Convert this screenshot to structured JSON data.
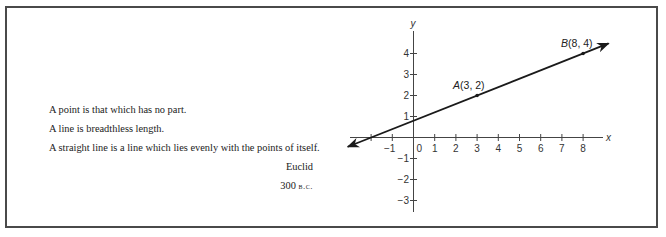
{
  "quote": {
    "lines": [
      "A point is that which has no part.",
      "A line is breadthless length.",
      "A straight line is a line which lies evenly with the points of itself."
    ],
    "author": "Euclid",
    "date_number": "300",
    "date_era": "b.c."
  },
  "chart_data": {
    "type": "line",
    "title": "",
    "xlabel": "x",
    "ylabel": "y",
    "xlim": [
      -3,
      9
    ],
    "ylim": [
      -3,
      4.5
    ],
    "x_ticks": [
      -2,
      -1,
      0,
      1,
      2,
      3,
      4,
      5,
      6,
      7,
      8
    ],
    "x_tick_labels": [
      "",
      "−1",
      "0",
      "1",
      "2",
      "3",
      "4",
      "5",
      "6",
      "7",
      "8"
    ],
    "y_ticks": [
      -3,
      -2,
      -1,
      1,
      2,
      3,
      4
    ],
    "y_tick_labels": [
      "−3",
      "−2",
      "−1",
      "1",
      "2",
      "3",
      "4"
    ],
    "grid": false,
    "line": {
      "description": "line through A and B, arrows at both ends",
      "slope": 0.4,
      "intercept": 0.8,
      "x_range": [
        -3.1,
        9.2
      ]
    },
    "points": [
      {
        "name": "A",
        "x": 3,
        "y": 2,
        "label_name": "A",
        "label_coords": "(3, 2)"
      },
      {
        "name": "B",
        "x": 8,
        "y": 4,
        "label_name": "B",
        "label_coords": "(8, 4)"
      }
    ],
    "line_color": "#1a1a1a",
    "axis_color": "#444444"
  }
}
